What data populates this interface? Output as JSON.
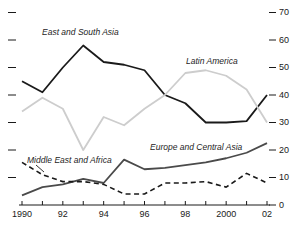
{
  "chart_data": {
    "type": "line",
    "title": "",
    "subtitle": "",
    "xlabel": "",
    "ylabel": "",
    "xlim": [
      1990,
      2002
    ],
    "ylim": [
      0,
      70
    ],
    "x": [
      1990,
      1991,
      1992,
      1993,
      1994,
      1995,
      1996,
      1997,
      1998,
      1999,
      2000,
      2001,
      2002
    ],
    "y_ticks": [
      0,
      10,
      20,
      30,
      40,
      50,
      60,
      70
    ],
    "y_tick_labels": [
      "0",
      "10",
      "20",
      "30",
      "40",
      "50",
      "60",
      "70"
    ],
    "y_axis_position": "right",
    "x_ticks": [
      1990,
      1991,
      1992,
      1993,
      1994,
      1995,
      1996,
      1997,
      1998,
      1999,
      2000,
      2001,
      2002
    ],
    "x_tick_labels": [
      "1990",
      "",
      "92",
      "",
      "94",
      "",
      "96",
      "",
      "98",
      "",
      "2000",
      "",
      "02"
    ],
    "grid": false,
    "legend": "inline-annotations",
    "series": [
      {
        "name": "East and South Asia",
        "style": "solid",
        "color": "#1a1a1a",
        "values": [
          45,
          41,
          50,
          58,
          52,
          51,
          49,
          40,
          37,
          30,
          30,
          30.5,
          40
        ]
      },
      {
        "name": "Latin America",
        "style": "solid",
        "color": "#cdcdcd",
        "values": [
          34,
          39,
          35,
          20,
          32,
          29,
          35,
          40,
          48,
          49,
          47,
          42,
          30
        ]
      },
      {
        "name": "Europe and Central Asia",
        "style": "solid",
        "color": "#4a4a4a",
        "values": [
          3.5,
          6.5,
          7.5,
          9.5,
          8,
          16.5,
          13,
          13.5,
          14.5,
          15.5,
          17,
          19,
          22.5
        ]
      },
      {
        "name": "Middle East and Africa",
        "style": "dashed",
        "color": "#1a1a1a",
        "values": [
          15.5,
          11,
          8.5,
          8.5,
          7.5,
          4,
          4,
          8,
          8,
          8.5,
          6.5,
          11.5,
          8
        ]
      }
    ],
    "annotations": [
      {
        "text": "East and South Asia",
        "series": "East and South Asia"
      },
      {
        "text": "Latin America",
        "series": "Latin America"
      },
      {
        "text": "Europe and Central Asia",
        "series": "Europe and Central Asia"
      },
      {
        "text": "Middle East and Africa",
        "series": "Middle East and Africa",
        "has_leader_line": true
      }
    ]
  }
}
